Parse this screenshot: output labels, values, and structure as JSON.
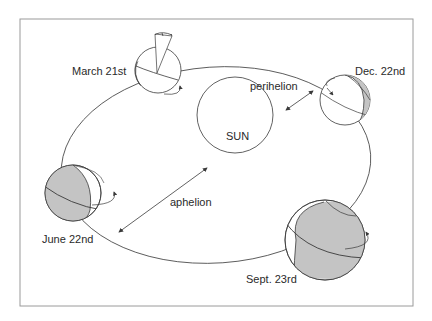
{
  "diagram": {
    "title": "",
    "colors": {
      "frame": "#9a9a9a",
      "line": "#3a3a3a",
      "shade": "#c4c4c4",
      "text": "#2a2a2a",
      "background": "#ffffff"
    },
    "center": {
      "label": "SUN"
    },
    "distances": {
      "near": "perihelion",
      "far": "aphelion"
    },
    "positions": [
      {
        "id": "march",
        "label": "March 21st",
        "shading": "none"
      },
      {
        "id": "december",
        "label": "Dec. 22nd",
        "shading": "crescent-right"
      },
      {
        "id": "june",
        "label": "June 22nd",
        "shading": "gibbous-left"
      },
      {
        "id": "september",
        "label": "Sept. 23rd",
        "shading": "gibbous-right"
      }
    ]
  }
}
